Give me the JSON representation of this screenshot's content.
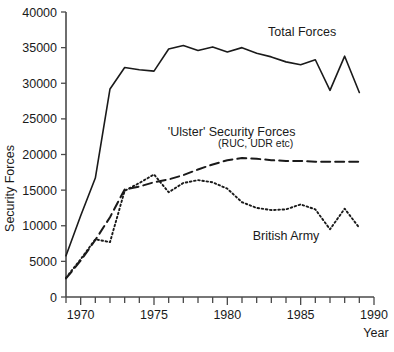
{
  "chart_data": {
    "type": "line",
    "title": "",
    "xlabel": "Year",
    "ylabel": "Security Forces",
    "xlim": [
      1969,
      1990
    ],
    "ylim": [
      0,
      40000
    ],
    "grid": false,
    "legend_position": "inline-annotations",
    "x_ticks_major": [
      1970,
      1975,
      1980,
      1985,
      1990
    ],
    "x_tick_labels": [
      "1970",
      "1975",
      "1980",
      "1985",
      "1990"
    ],
    "x_ticks_minor": [
      1969,
      1971,
      1972,
      1973,
      1974,
      1976,
      1977,
      1978,
      1979,
      1981,
      1982,
      1983,
      1984,
      1986,
      1987,
      1988,
      1989
    ],
    "y_ticks": [
      0,
      5000,
      10000,
      15000,
      20000,
      25000,
      30000,
      35000,
      40000
    ],
    "y_tick_labels": [
      "0",
      "5000",
      "10000",
      "15000",
      "20000",
      "25000",
      "30000",
      "35000",
      "40000"
    ],
    "x": [
      1969,
      1970,
      1971,
      1972,
      1973,
      1974,
      1975,
      1976,
      1977,
      1978,
      1979,
      1980,
      1981,
      1982,
      1983,
      1984,
      1985,
      1986,
      1987,
      1988,
      1989
    ],
    "series": [
      {
        "name": "Total Forces",
        "style": "solid",
        "color": "#1a1a1a",
        "label": "Total Forces",
        "label_x": 1985.1,
        "label_y": 36700,
        "values": [
          5800,
          11400,
          16700,
          29200,
          32200,
          31900,
          31700,
          34800,
          35300,
          34600,
          35100,
          34400,
          35000,
          34200,
          33700,
          33000,
          32600,
          33300,
          29000,
          33800,
          28700
        ]
      },
      {
        "name": "'Ulster' Security Forces",
        "style": "dashed",
        "color": "#1a1a1a",
        "label": "'Ulster' Security Forces",
        "sublabel": "(RUC, UDR etc)",
        "label_x": 1980.3,
        "label_y": 22600,
        "sublabel_y": 21100,
        "values": [
          2600,
          5100,
          8000,
          11200,
          15100,
          15500,
          16100,
          16500,
          17100,
          17900,
          18600,
          19200,
          19500,
          19400,
          19200,
          19100,
          19100,
          19000,
          19000,
          19000,
          19000
        ]
      },
      {
        "name": "British Army",
        "style": "dotted",
        "color": "#4a4a4a",
        "label": "British Army",
        "label_x": 1984.0,
        "label_y": 8000,
        "values": [
          2700,
          5300,
          8100,
          7700,
          14900,
          16000,
          17200,
          14700,
          16000,
          16400,
          16100,
          15200,
          13300,
          12500,
          12200,
          12300,
          13000,
          12300,
          9500,
          12400,
          9700
        ]
      }
    ]
  }
}
